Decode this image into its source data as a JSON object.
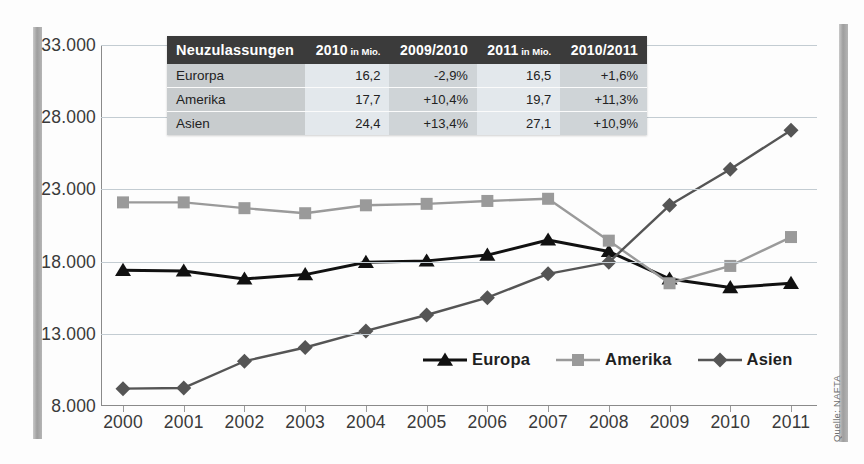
{
  "source_note": "Quelle: NAFTA",
  "axis": {
    "y_ticks": [
      "33.000",
      "28.000",
      "23.000",
      "18.000",
      "13.000",
      "8.000"
    ],
    "x_ticks": [
      "2000",
      "2001",
      "2002",
      "2003",
      "2004",
      "2005",
      "2006",
      "2007",
      "2008",
      "2009",
      "2010",
      "2011"
    ]
  },
  "legend": {
    "items": [
      {
        "label": "Europa",
        "marker": "triangle-marker",
        "color": "#111111"
      },
      {
        "label": "Amerika",
        "marker": "square-marker",
        "color": "#9a9a9a"
      },
      {
        "label": "Asien",
        "marker": "diamond-marker",
        "color": "#555555"
      }
    ]
  },
  "table": {
    "headers": [
      "Neuzulassungen",
      "2010",
      "2009/2010",
      "2011",
      "2010/2011"
    ],
    "header_units": [
      "",
      "in Mio.",
      "",
      "in Mio.",
      ""
    ],
    "rows": [
      {
        "region": "Eurorpa",
        "v2010": "16,2",
        "c0910": "-2,9%",
        "v2011": "16,5",
        "c1011": "+1,6%"
      },
      {
        "region": "Amerika",
        "v2010": "17,7",
        "c0910": "+10,4%",
        "v2011": "19,7",
        "c1011": "+11,3%"
      },
      {
        "region": "Asien",
        "v2010": "24,4",
        "c0910": "+13,4%",
        "v2011": "27,1",
        "c1011": "+10,9%"
      }
    ]
  },
  "chart_data": {
    "type": "line",
    "title": "",
    "xlabel": "",
    "ylabel": "",
    "x": [
      2000,
      2001,
      2002,
      2003,
      2004,
      2005,
      2006,
      2007,
      2008,
      2009,
      2010,
      2011
    ],
    "ylim": [
      8000,
      33000
    ],
    "yticks": [
      8000,
      13000,
      18000,
      23000,
      28000,
      33000
    ],
    "grid": true,
    "legend_position": "bottom-right",
    "series": [
      {
        "name": "Europa",
        "color": "#111111",
        "marker": "triangle",
        "values": [
          17400,
          17350,
          16800,
          17100,
          17950,
          18050,
          18450,
          19500,
          18700,
          16800,
          16200,
          16500
        ]
      },
      {
        "name": "Amerika",
        "color": "#9a9a9a",
        "marker": "square",
        "values": [
          22100,
          22100,
          21700,
          21350,
          21900,
          22000,
          22200,
          22350,
          19450,
          16500,
          17700,
          19700
        ]
      },
      {
        "name": "Asien",
        "color": "#555555",
        "marker": "diamond",
        "values": [
          9200,
          9250,
          11100,
          12050,
          13200,
          14300,
          15500,
          17150,
          17950,
          21900,
          24400,
          27100
        ]
      }
    ]
  }
}
